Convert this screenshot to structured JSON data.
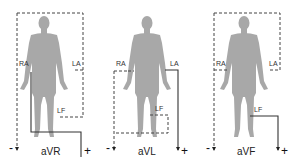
{
  "figure": {
    "colors": {
      "body": "#a8a8a8",
      "wire": "#333333",
      "background": "#ffffff"
    },
    "panels": [
      {
        "lead": "aVR",
        "electrodes": [
          "RA",
          "LA",
          "LF"
        ],
        "positive": "RA",
        "negative_combined": [
          "LA",
          "LF"
        ],
        "minus": "-",
        "plus": "+"
      },
      {
        "lead": "aVL",
        "electrodes": [
          "RA",
          "LA",
          "LF"
        ],
        "positive": "LA",
        "negative_combined": [
          "RA",
          "LF"
        ],
        "minus": "-",
        "plus": "+"
      },
      {
        "lead": "aVF",
        "electrodes": [
          "RA",
          "LA",
          "LF"
        ],
        "positive": "LF",
        "negative_combined": [
          "RA",
          "LA"
        ],
        "minus": "-",
        "plus": "+"
      }
    ]
  }
}
